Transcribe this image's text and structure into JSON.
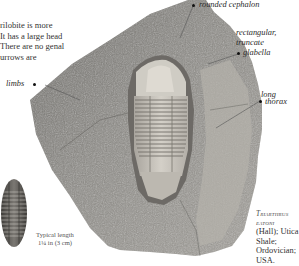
{
  "intro": {
    "lines": [
      "rilobite is more",
      " It has a large head",
      "There are no genal",
      "urrows are"
    ]
  },
  "labels": {
    "cephalon": "rounded cephalon",
    "glabella_line1": "rectangular,",
    "glabella_line2": "truncate",
    "glabella_line3": "glabella",
    "thorax_line1": "long",
    "thorax_line2": "thorax",
    "limbs": "limbs"
  },
  "caption": {
    "species_line1": "Triarthrus",
    "species_line2": "eatoni",
    "line3": "(Hall); Utica",
    "line4": "Shale;",
    "line5": "Ordovician;",
    "line6": "USA."
  },
  "typical_length": {
    "line1": "Typical length",
    "line2": "1¼ in (3 cm)"
  },
  "colors": {
    "background": "#ffffff",
    "rock": "#8c8a86",
    "rock_dark": "#5e5c59",
    "fossil": "#c9c6bf",
    "text": "#2a2a2a"
  }
}
